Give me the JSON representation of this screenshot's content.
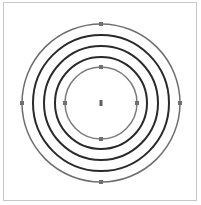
{
  "diagram": {
    "type": "concentric-circles",
    "center": {
      "x": 101,
      "y": 103
    },
    "rings": [
      {
        "name": "outer-ring",
        "radius": 79,
        "color": "#6e6e6e",
        "stroke_width": 1.5,
        "handles": true
      },
      {
        "name": "ring-2",
        "radius": 68,
        "color": "#2a2a2a",
        "stroke_width": 2,
        "handles": false
      },
      {
        "name": "ring-3",
        "radius": 57,
        "color": "#2a2a2a",
        "stroke_width": 2,
        "handles": false
      },
      {
        "name": "ring-4",
        "radius": 46,
        "color": "#2a2a2a",
        "stroke_width": 2,
        "handles": false
      },
      {
        "name": "inner-ring",
        "radius": 36,
        "color": "#7a7a7a",
        "stroke_width": 1.5,
        "handles": true
      }
    ],
    "handle_color": "#707070",
    "center_marker_color": "#606060",
    "frame_border_color": "#c8c8c8"
  }
}
